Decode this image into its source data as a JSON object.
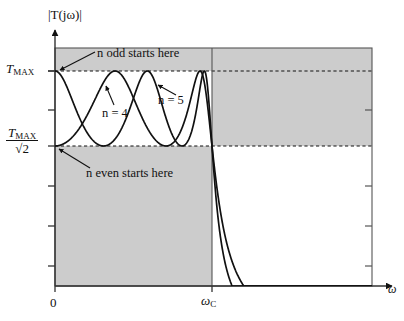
{
  "figure": {
    "title": "",
    "background_color": "#ffffff",
    "shade_color": "#cccccc",
    "curve_color": "#111111",
    "axis_color": "#444444"
  },
  "axes": {
    "y_axis_label": "|T(jω)|",
    "x_axis_label": "ω",
    "x_ticks": [
      {
        "value": 0,
        "label": "0"
      },
      {
        "value": 1,
        "label": "ω",
        "sub": "C"
      }
    ],
    "y_ticks": [
      {
        "label_main": "T",
        "label_sub": "MAX",
        "value": 1.0
      },
      {
        "label_main": "T",
        "label_sub": "MAX",
        "denominator": "√2",
        "value": 0.7071
      }
    ],
    "xlim": [
      0,
      1.885
    ],
    "ylim": [
      0,
      1.17
    ],
    "grid": false
  },
  "annotations": [
    {
      "name": "n-odd-start",
      "text": "n odd starts here"
    },
    {
      "name": "n-even-start",
      "text": "n even starts here"
    },
    {
      "name": "curve-label-n4",
      "text": "n = 4"
    },
    {
      "name": "curve-label-n5",
      "text": "n = 5"
    }
  ],
  "regions": [
    {
      "name": "passband-lower-shade",
      "description": "shaded below TMAX/sqrt2 for ω < ωC"
    },
    {
      "name": "passband-upper-shade",
      "description": "shaded above TMAX for ω < ωC"
    },
    {
      "name": "stopband-upper-shade",
      "description": "shaded above TMAX/sqrt2 for ω > ωC"
    }
  ],
  "chart_data": {
    "type": "line",
    "title": "",
    "xlabel": "ω",
    "ylabel": "|T(jω)|",
    "xlim": [
      0,
      1.885
    ],
    "ylim": [
      0,
      1.17
    ],
    "grid": false,
    "legend": [
      "n = 4",
      "n = 5"
    ],
    "reference_lines": [
      {
        "name": "TMAX",
        "axis": "y",
        "value": 1.0,
        "style": "dashed",
        "label": "T_MAX"
      },
      {
        "name": "TMAX_over_sqrt2",
        "axis": "y",
        "value": 0.7071,
        "style": "dashed",
        "label": "T_MAX/√2"
      },
      {
        "name": "cutoff",
        "axis": "x",
        "value": 1.0,
        "style": "solid",
        "label": "ω_C"
      }
    ],
    "series": [
      {
        "name": "n = 4",
        "order": 4,
        "parity": "even",
        "starts_at": 0.7071,
        "ripple_min": 0.7071,
        "ripple_max": 1.0,
        "x": [
          0.0,
          0.05,
          0.1,
          0.15,
          0.2,
          0.25,
          0.3,
          0.35,
          0.3827,
          0.4,
          0.45,
          0.5,
          0.55,
          0.6,
          0.65,
          0.7,
          0.7071,
          0.75,
          0.8,
          0.85,
          0.9,
          0.9239,
          0.95,
          1.0,
          1.05,
          1.1,
          1.15,
          1.2,
          1.3,
          1.4,
          1.5,
          1.6,
          1.7,
          1.8
        ],
        "y": [
          0.7071,
          0.7081,
          0.7181,
          0.7434,
          0.7891,
          0.8552,
          0.9295,
          0.9883,
          1.0,
          0.9969,
          0.9339,
          0.8265,
          0.7416,
          0.7075,
          0.7413,
          0.8559,
          0.8743,
          0.9731,
          1.0,
          0.9425,
          0.7945,
          0.7071,
          0.7339,
          1.0,
          0.6068,
          0.3703,
          0.2424,
          0.1683,
          0.0918,
          0.0559,
          0.0367,
          0.0255,
          0.0185,
          0.0139
        ]
      },
      {
        "name": "n = 5",
        "order": 5,
        "parity": "odd",
        "starts_at": 1.0,
        "ripple_min": 0.7071,
        "ripple_max": 1.0,
        "x": [
          0.0,
          0.05,
          0.1,
          0.15,
          0.2,
          0.25,
          0.3,
          0.309,
          0.35,
          0.4,
          0.45,
          0.5,
          0.55,
          0.5878,
          0.6,
          0.65,
          0.7,
          0.75,
          0.8,
          0.809,
          0.85,
          0.9,
          0.95,
          0.9511,
          1.0,
          1.05,
          1.1,
          1.15,
          1.2,
          1.3,
          1.4,
          1.5,
          1.6,
          1.7,
          1.8
        ],
        "y": [
          1.0,
          0.9985,
          0.9766,
          0.9185,
          0.8319,
          0.7484,
          0.7074,
          0.7071,
          0.7368,
          0.8362,
          0.9397,
          0.9955,
          0.9575,
          0.9071,
          0.8724,
          0.7653,
          0.7084,
          0.76,
          0.9251,
          0.956,
          0.9995,
          0.8806,
          0.7108,
          0.7071,
          1.0,
          0.5224,
          0.2814,
          0.1704,
          0.112,
          0.0553,
          0.0315,
          0.0197,
          0.0132,
          0.0093,
          0.0068
        ]
      }
    ]
  }
}
